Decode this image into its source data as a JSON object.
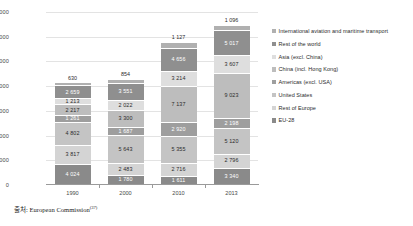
{
  "caption": {
    "prefix": "출처: European Commission",
    "superscript": "(37)"
  },
  "chart_data": {
    "type": "bar",
    "subtype": "stacked-bar",
    "title": "",
    "subtitle": "",
    "xlabel": "",
    "ylabel": "",
    "categories": [
      "1990",
      "2000",
      "2010",
      "2013"
    ],
    "ylim": [
      0,
      35000
    ],
    "yticks": [
      0,
      5000,
      10000,
      15000,
      20000,
      25000,
      30000,
      35000
    ],
    "ytick_labels": [
      "0",
      "5 000",
      "10 000",
      "15 000",
      "20 000",
      "25 000",
      "30 000",
      "35 000"
    ],
    "grid": true,
    "legend_position": "right",
    "stack_order": "bottom-to-top",
    "series": [
      {
        "name": "EU-28",
        "color": "#8a8a8a",
        "label_color": "light",
        "values": [
          4024,
          1780,
          1611,
          3340
        ],
        "value_labels": [
          "4 024",
          "1 780",
          "1 611",
          "3 340"
        ]
      },
      {
        "name": "Rest of Europe",
        "color": "#d4d4d4",
        "label_color": "dark",
        "values": [
          3817,
          2483,
          2716,
          2796
        ],
        "value_labels": [
          "3 817",
          "2 483",
          "2 716",
          "2 796"
        ]
      },
      {
        "name": "United States",
        "color": "#c4c4c4",
        "label_color": "dark",
        "values": [
          4802,
          5643,
          5355,
          5120
        ],
        "value_labels": [
          "4 802",
          "5 643",
          "5 355",
          "5 120"
        ]
      },
      {
        "name": "Americas (excl. USA)",
        "color": "#9e9e9e",
        "label_color": "light",
        "values": [
          1261,
          1687,
          2920,
          2198
        ],
        "value_labels": [
          "1 261",
          "1 687",
          "2 920",
          "2 198"
        ]
      },
      {
        "name": "China (incl. Hong Kong)",
        "color": "#bdbdbd",
        "label_color": "dark",
        "values": [
          2217,
          3300,
          7137,
          9023
        ],
        "value_labels": [
          "2 217",
          "3 300",
          "7 137",
          "9 023"
        ]
      },
      {
        "name": "Asia (excl. China)",
        "color": "#dedede",
        "label_color": "dark",
        "values": [
          1213,
          2022,
          3214,
          3607
        ],
        "value_labels": [
          "1 213",
          "2 022",
          "3 214",
          "3 607"
        ]
      },
      {
        "name": "Rest of the world",
        "color": "#8f8f8f",
        "label_color": "light",
        "values": [
          2659,
          3551,
          4656,
          5017
        ],
        "value_labels": [
          "2 659",
          "3 551",
          "4 656",
          "5 017"
        ]
      },
      {
        "name": "International aviation and maritime transport",
        "color": "#b0b0b0",
        "label_color": "dark",
        "values": [
          630,
          854,
          1127,
          1096
        ],
        "value_labels": [
          "630",
          "854",
          "1 127",
          "1 096"
        ],
        "label_outside": true
      }
    ],
    "totals": [
      20623,
      21320,
      28736,
      32197
    ]
  },
  "legend": {
    "items": [
      {
        "label": "International aviation and maritime transport",
        "color": "#b0b0b0"
      },
      {
        "label": "Rest of the world",
        "color": "#8f8f8f"
      },
      {
        "label": "Asia (excl. China)",
        "color": "#dedede"
      },
      {
        "label": "China (incl. Hong Kong)",
        "color": "#bdbdbd"
      },
      {
        "label": "Americas (excl. USA)",
        "color": "#9e9e9e"
      },
      {
        "label": "United States",
        "color": "#c4c4c4"
      },
      {
        "label": "Rest of Europe",
        "color": "#d4d4d4"
      },
      {
        "label": "EU-28",
        "color": "#8a8a8a"
      }
    ]
  }
}
